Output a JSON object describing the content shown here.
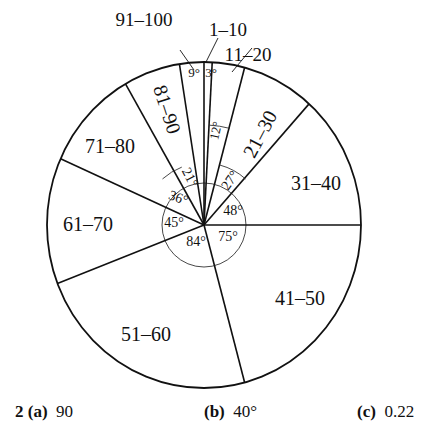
{
  "chart_data": {
    "type": "pie",
    "title": "",
    "unit": "degrees",
    "start_angle_deg_from_top": 0,
    "direction": "clockwise",
    "categories": [
      "1–10",
      "11–20",
      "21–30",
      "31–40",
      "41–50",
      "51–60",
      "61–70",
      "71–80",
      "81–90",
      "91–100"
    ],
    "values": [
      3,
      12,
      27,
      48,
      75,
      84,
      45,
      36,
      21,
      9
    ],
    "angle_labels": [
      "3°",
      "12°",
      "27°",
      "48°",
      "75°",
      "84°",
      "45°",
      "36°",
      "21°",
      "9°"
    ],
    "total": 360,
    "legend": "none (labels in/near slices)"
  },
  "geometry": {
    "cx": 204,
    "cy": 225,
    "rx": 157,
    "ry": 163,
    "inner_r": 42
  },
  "answers": [
    {
      "prefix": "2",
      "part": "(a)",
      "value": "90"
    },
    {
      "part": "(b)",
      "value": "40°"
    },
    {
      "part": "(c)",
      "value": "0.22"
    }
  ]
}
